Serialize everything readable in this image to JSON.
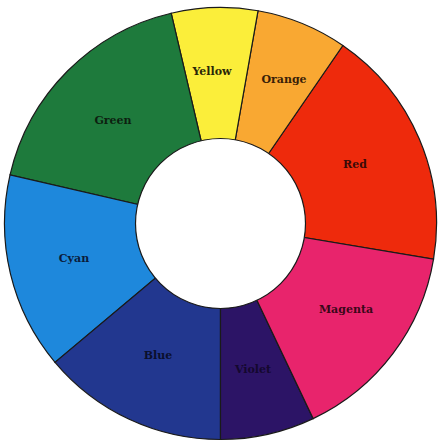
{
  "wheel": {
    "center": [
      220.5,
      223.5
    ],
    "outer_radius": 216,
    "inner_radius": 85,
    "hole_color": "#ffffff",
    "segments": [
      {
        "name": "Red",
        "start": -9.5,
        "end": 55.5,
        "color": "#ee2a0c",
        "label_pos": [
          355,
          165
        ],
        "text_color": "#3a0a08"
      },
      {
        "name": "Orange",
        "start": 55.5,
        "end": 80,
        "color": "#f9a832",
        "label_pos": [
          284,
          80
        ],
        "text_color": "#3a1f08"
      },
      {
        "name": "Yellow",
        "start": 80,
        "end": 103.2,
        "color": "#fbee3a",
        "label_pos": [
          212,
          72
        ],
        "text_color": "#2a2608"
      },
      {
        "name": "Green",
        "start": 103.2,
        "end": 167,
        "color": "#1e7a3c",
        "label_pos": [
          113,
          121
        ],
        "text_color": "#0d1f10"
      },
      {
        "name": "Cyan",
        "start": 167,
        "end": 220,
        "color": "#1e88dc",
        "label_pos": [
          74,
          259
        ],
        "text_color": "#0b1c3a"
      },
      {
        "name": "Blue",
        "start": 220,
        "end": 270,
        "color": "#22378f",
        "label_pos": [
          158,
          356
        ],
        "text_color": "#0a0f2c"
      },
      {
        "name": "Violet",
        "start": 270,
        "end": 295.4,
        "color": "#2c1466",
        "label_pos": [
          253,
          370
        ],
        "text_color": "#14082e"
      },
      {
        "name": "Magenta",
        "start": 295.4,
        "end": 350.5,
        "color": "#e8246c",
        "label_pos": [
          346,
          310
        ],
        "text_color": "#3a0718"
      }
    ]
  }
}
